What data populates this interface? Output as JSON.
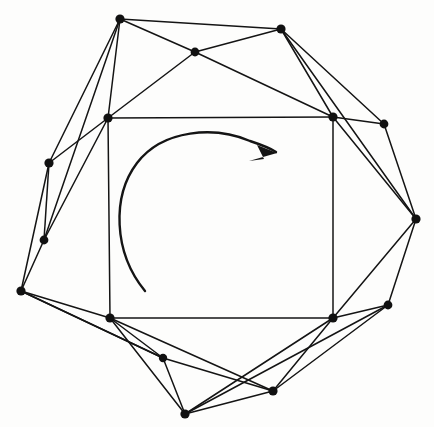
{
  "figure": {
    "title": "Rotating polygon graph diagram",
    "background_color": "#fdfdfc",
    "stroke_color": "#141414",
    "vertex_color": "#111111",
    "canvas": {
      "width": 434,
      "height": 427
    }
  },
  "chart_data": {
    "type": "scatter",
    "title": "Rotating polygon graph diagram",
    "xlabel": "",
    "ylabel": "",
    "xlim": [
      0,
      434
    ],
    "ylim": [
      0,
      427
    ],
    "grid": false,
    "legend": "none",
    "vertices": [
      {
        "id": "v1",
        "label": "top-left-outer",
        "x": 120,
        "y": 19,
        "r": 4.6
      },
      {
        "id": "v2",
        "label": "top-mid-inner",
        "x": 195,
        "y": 52,
        "r": 4.4
      },
      {
        "id": "v3",
        "label": "top-right-outer",
        "x": 281,
        "y": 29,
        "r": 4.6
      },
      {
        "id": "v4",
        "label": "right-upper-outer",
        "x": 384,
        "y": 124,
        "r": 4.4
      },
      {
        "id": "v5",
        "label": "right-outer",
        "x": 416,
        "y": 219,
        "r": 4.6
      },
      {
        "id": "v6",
        "label": "right-lower-outer",
        "x": 388,
        "y": 305,
        "r": 4.4
      },
      {
        "id": "v7",
        "label": "bottom-right-outer",
        "x": 273,
        "y": 391,
        "r": 4.6
      },
      {
        "id": "v8",
        "label": "bottom-outer",
        "x": 185,
        "y": 414,
        "r": 4.6
      },
      {
        "id": "v9",
        "label": "bottom-left-mid",
        "x": 163,
        "y": 358,
        "r": 4.2
      },
      {
        "id": "v10",
        "label": "left-lower-outer",
        "x": 21,
        "y": 291,
        "r": 4.6
      },
      {
        "id": "v11",
        "label": "left-mid-outer",
        "x": 44,
        "y": 240,
        "r": 4.4
      },
      {
        "id": "v12",
        "label": "left-upper-outer",
        "x": 49,
        "y": 163,
        "r": 4.6
      },
      {
        "id": "q1",
        "label": "square-top-left",
        "x": 108,
        "y": 118,
        "r": 4.6
      },
      {
        "id": "q2",
        "label": "square-top-right",
        "x": 333,
        "y": 117,
        "r": 4.6
      },
      {
        "id": "q3",
        "label": "square-bottom-right",
        "x": 333,
        "y": 318,
        "r": 4.6
      },
      {
        "id": "q4",
        "label": "square-bottom-left",
        "x": 110,
        "y": 318,
        "r": 4.6
      }
    ],
    "edges": [
      [
        "q1",
        "q2"
      ],
      [
        "q2",
        "q3"
      ],
      [
        "q3",
        "q4"
      ],
      [
        "q4",
        "q1"
      ],
      [
        "v1",
        "v2"
      ],
      [
        "v2",
        "v3"
      ],
      [
        "v1",
        "v3"
      ],
      [
        "v1",
        "q1"
      ],
      [
        "v1",
        "v12"
      ],
      [
        "v1",
        "v11"
      ],
      [
        "v2",
        "q1"
      ],
      [
        "v2",
        "q2"
      ],
      [
        "v3",
        "q2"
      ],
      [
        "v3",
        "v4"
      ],
      [
        "v3",
        "v5"
      ],
      [
        "v4",
        "q2"
      ],
      [
        "v4",
        "v5"
      ],
      [
        "v5",
        "q2"
      ],
      [
        "v5",
        "v6"
      ],
      [
        "v5",
        "q3"
      ],
      [
        "v6",
        "q3"
      ],
      [
        "v6",
        "v7"
      ],
      [
        "v6",
        "v8"
      ],
      [
        "v7",
        "q3"
      ],
      [
        "v7",
        "v8"
      ],
      [
        "v7",
        "v9"
      ],
      [
        "v8",
        "v9"
      ],
      [
        "v8",
        "q4"
      ],
      [
        "v9",
        "q4"
      ],
      [
        "v9",
        "v10"
      ],
      [
        "v10",
        "q4"
      ],
      [
        "v10",
        "v11"
      ],
      [
        "v10",
        "v12"
      ],
      [
        "v10",
        "v9"
      ],
      [
        "v11",
        "v12"
      ],
      [
        "v11",
        "q1"
      ],
      [
        "v12",
        "q1"
      ],
      [
        "q3",
        "v8"
      ],
      [
        "q4",
        "v7"
      ]
    ],
    "edge_count": 39,
    "vertex_count": 16,
    "annotation": {
      "type": "rotation-arrow",
      "direction": "clockwise",
      "path": "M 145 291 C 113 252 112 196 137 163 C 163 129 215 126 250 141 C 262 145 270 148 276 152",
      "arrowhead_points": "277 153 257 145 264 159 249 161",
      "stroke_width": 2.4
    }
  }
}
